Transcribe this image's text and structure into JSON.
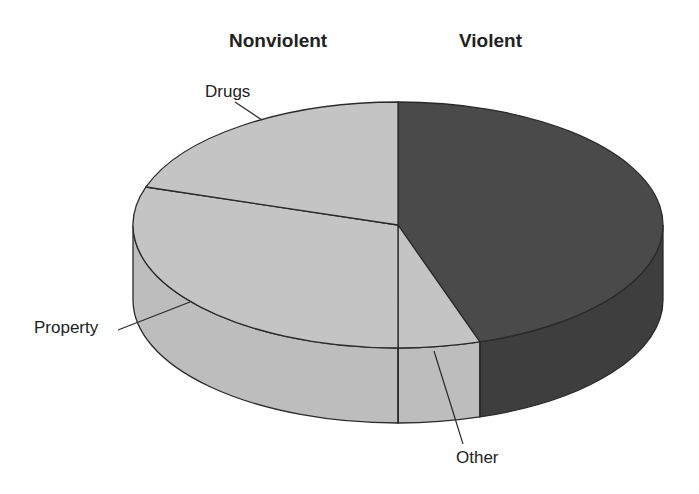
{
  "chart_data": {
    "type": "pie",
    "style": "3d",
    "title": "",
    "group_headers": [
      "Nonviolent",
      "Violent"
    ],
    "categories": [
      "Violent",
      "Other",
      "Property",
      "Drugs"
    ],
    "values": [
      45,
      5,
      30,
      20
    ],
    "unit": "percent (estimated from slice angles)",
    "groups": {
      "Violent": [
        "Violent"
      ],
      "Nonviolent": [
        "Other",
        "Property",
        "Drugs"
      ]
    },
    "colors": {
      "Violent": "#4a4a4a",
      "Other": "#c4c4c4",
      "Property": "#c4c4c4",
      "Drugs": "#c4c4c4"
    },
    "annotations": [
      "Drugs",
      "Property",
      "Other"
    ],
    "legend": "none"
  },
  "headers": {
    "nonviolent": "Nonviolent",
    "violent": "Violent"
  },
  "labels": {
    "drugs": "Drugs",
    "property": "Property",
    "other": "Other"
  }
}
